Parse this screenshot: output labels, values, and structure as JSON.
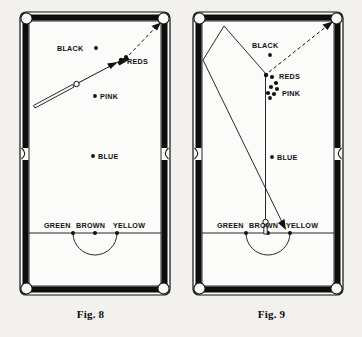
{
  "page": {
    "background_color": "#f2f1ee",
    "ink_color": "#111111",
    "cushion_color": "#0d0d0d",
    "cloth_color": "#fbfbf9",
    "figure_count": 2
  },
  "figures": [
    {
      "id": "fig-8",
      "caption": "Fig. 8",
      "description": "Snooker table plan with cue striking the cue ball toward the reds and a dashed line to the top right pocket",
      "ball_labels": [
        {
          "name": "BLACK",
          "text": "BLACK",
          "spot_side": "right"
        },
        {
          "name": "REDS",
          "text": "REDS",
          "spot_side": "none"
        },
        {
          "name": "PINK",
          "text": "PINK",
          "spot_side": "left"
        },
        {
          "name": "BLUE",
          "text": "BLUE",
          "spot_side": "left"
        },
        {
          "name": "GREEN",
          "text": "GREEN",
          "spot_side": "below"
        },
        {
          "name": "BROWN",
          "text": "BROWN",
          "spot_side": "below"
        },
        {
          "name": "YELLOW",
          "text": "YELLOW",
          "spot_side": "below"
        }
      ],
      "markings": {
        "baulk_line": true,
        "d_arc": true,
        "cue_stick": true,
        "cue_ball": true,
        "solid_arrow": true,
        "dashed_arrow": true,
        "reds_cluster_style": "compact"
      }
    },
    {
      "id": "fig-9",
      "caption": "Fig. 9",
      "description": "Snooker table plan with cue ball on the baulk line, a vertical path to the reds, rebound lines off the top cushion and a dashed line to the top right pocket",
      "ball_labels": [
        {
          "name": "BLACK",
          "text": "BLACK",
          "spot_side": "below"
        },
        {
          "name": "REDS",
          "text": "REDS",
          "spot_side": "none"
        },
        {
          "name": "PINK",
          "text": "PINK",
          "spot_side": "left"
        },
        {
          "name": "BLUE",
          "text": "BLUE",
          "spot_side": "left"
        },
        {
          "name": "GREEN",
          "text": "GREEN",
          "spot_side": "below"
        },
        {
          "name": "BROWN",
          "text": "BROWN",
          "spot_side": "below"
        },
        {
          "name": "YELLOW",
          "text": "YELLOW",
          "spot_side": "below"
        }
      ],
      "markings": {
        "baulk_line": true,
        "d_arc": true,
        "cue_stick": true,
        "cue_ball": true,
        "solid_arrow": true,
        "dashed_arrow": true,
        "reds_cluster_style": "scattered"
      }
    }
  ]
}
